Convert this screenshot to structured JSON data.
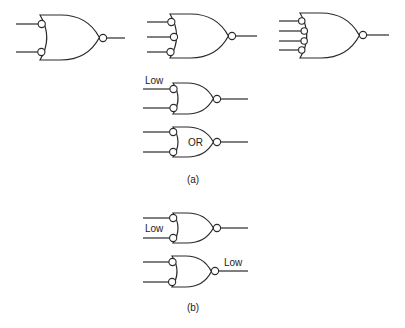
{
  "figure": {
    "part_a": {
      "caption": "(a)",
      "gates": [
        {
          "id": "g1",
          "type": "NOR-with-inverted-inputs",
          "inputs": 2,
          "x": 40,
          "top": 15,
          "bottom": 60,
          "input_ys": [
            24,
            52
          ],
          "out_x": 103,
          "out_y": 38,
          "in_start": 16,
          "out_end": 125,
          "inner_label": "",
          "input_label": "",
          "output_label": ""
        },
        {
          "id": "g2",
          "type": "NOR-with-inverted-inputs",
          "inputs": 3,
          "x": 170,
          "top": 14,
          "bottom": 58,
          "input_ys": [
            22,
            37,
            52
          ],
          "out_x": 232,
          "out_y": 36,
          "in_start": 147,
          "out_end": 257,
          "inner_label": "",
          "input_label": "",
          "output_label": ""
        },
        {
          "id": "g3",
          "type": "NOR-with-inverted-inputs",
          "inputs": 4,
          "x": 300,
          "top": 13,
          "bottom": 58,
          "input_ys": [
            21,
            31,
            41,
            50
          ],
          "out_x": 363,
          "out_y": 35,
          "in_start": 279,
          "out_end": 389,
          "inner_label": "",
          "input_label": "",
          "output_label": ""
        },
        {
          "id": "g4",
          "type": "NOR-with-inverted-inputs",
          "inputs": 2,
          "x": 173,
          "top": 83,
          "bottom": 114,
          "input_ys": [
            89,
            108
          ],
          "out_x": 217,
          "out_y": 99,
          "in_start": 143,
          "out_end": 248,
          "inner_label": "",
          "input_label": "Low",
          "output_label": ""
        },
        {
          "id": "g5",
          "type": "NOR-with-inverted-inputs",
          "inputs": 2,
          "x": 173,
          "top": 127,
          "bottom": 157,
          "input_ys": [
            132,
            152
          ],
          "out_x": 217,
          "out_y": 142,
          "in_start": 143,
          "out_end": 248,
          "inner_label": "OR",
          "input_label": "",
          "output_label": ""
        }
      ]
    },
    "part_b": {
      "caption": "(b)",
      "gates": [
        {
          "id": "g6",
          "type": "NOR-with-inverted-inputs",
          "inputs": 2,
          "x": 173,
          "top": 213,
          "bottom": 243,
          "input_ys": [
            218,
            238
          ],
          "out_x": 217,
          "out_y": 228,
          "in_start": 143,
          "out_end": 248,
          "inner_label": "",
          "input_label": "Low",
          "output_label": ""
        },
        {
          "id": "g7",
          "type": "NOR-with-inverted-inputs",
          "inputs": 2,
          "x": 172,
          "top": 256,
          "bottom": 287,
          "input_ys": [
            262,
            282
          ],
          "out_x": 215,
          "out_y": 271,
          "in_start": 143,
          "out_end": 248,
          "inner_label": "",
          "input_label": "",
          "output_label": "Low"
        }
      ]
    },
    "labels": {
      "g4_input": "Low",
      "g5_inner": "OR",
      "g6_input": "Low",
      "g7_output": "Low",
      "caption_a": "(a)",
      "caption_b": "(b)"
    },
    "colors": {
      "stroke": "#2a2a2a",
      "background": "#ffffff",
      "text": "#222222"
    }
  }
}
